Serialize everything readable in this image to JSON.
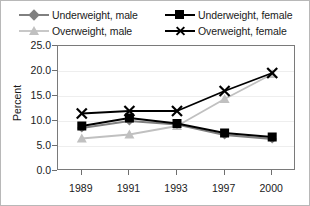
{
  "chart_data": {
    "type": "line",
    "title": "",
    "xlabel": "",
    "ylabel": "Percent",
    "categories": [
      "1989",
      "1991",
      "1993",
      "1997",
      "2000"
    ],
    "ylim": [
      0.0,
      25.0
    ],
    "ytick_labels": [
      "25.0",
      "20.0",
      "15.0",
      "10.0",
      "5.0",
      "0.0"
    ],
    "ytick_values": [
      25.0,
      20.0,
      15.0,
      10.0,
      5.0,
      0.0
    ],
    "grid": true,
    "legend_position": "top",
    "series": [
      {
        "name": "Underweight, male",
        "marker": "diamond",
        "color": "#808080",
        "values": [
          8.6,
          10.0,
          9.3,
          7.2,
          6.4
        ]
      },
      {
        "name": "Underweight, female",
        "marker": "square",
        "color": "#000000",
        "values": [
          9.0,
          10.6,
          9.5,
          7.6,
          6.8
        ]
      },
      {
        "name": "Overweight, male",
        "marker": "triangle",
        "color": "#c0c0c0",
        "values": [
          6.5,
          7.3,
          9.0,
          14.4,
          19.4
        ]
      },
      {
        "name": "Overweight, female",
        "marker": "x",
        "color": "#000000",
        "values": [
          11.5,
          12.0,
          12.0,
          16.0,
          19.6
        ]
      }
    ]
  },
  "legend": {
    "items": [
      {
        "label": "Underweight, male",
        "marker": "diamond-marker-icon",
        "color": "#808080"
      },
      {
        "label": "Underweight, female",
        "marker": "square-marker-icon",
        "color": "#000000"
      },
      {
        "label": "Overweight, male",
        "marker": "triangle-marker-icon",
        "color": "#c0c0c0"
      },
      {
        "label": "Overweight, female",
        "marker": "x-marker-icon",
        "color": "#000000"
      }
    ]
  },
  "axes": {
    "y_title": "Percent",
    "y_ticks": [
      "25.0",
      "20.0",
      "15.0",
      "10.0",
      "5.0",
      "0.0"
    ],
    "x_ticks": [
      "1989",
      "1991",
      "1993",
      "1997",
      "2000"
    ]
  }
}
